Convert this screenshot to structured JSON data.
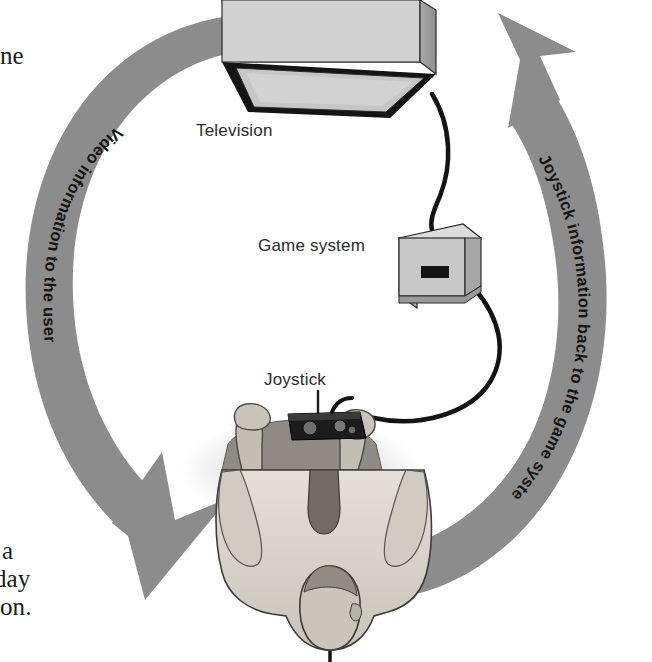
{
  "figure": {
    "name": "game-system-feedback-loop"
  },
  "page_text_fragments": [
    {
      "id": "ne",
      "text": "ne"
    },
    {
      "id": "a",
      "text": "a"
    },
    {
      "id": "day",
      "text": "day"
    },
    {
      "id": "on",
      "text": "on."
    }
  ],
  "callouts": {
    "television": "Television",
    "game_system": "Game system",
    "joystick": "Joystick"
  },
  "arrows": {
    "left": {
      "label": "Video information to the user",
      "direction": "downward-clockwise-to-user"
    },
    "right": {
      "label": "Joystick information back to the game system",
      "direction": "upward-clockwise-to-television"
    }
  },
  "colors": {
    "arrow_gray": "#8c8c8c",
    "arrow_gray_dark": "#7d7d7d",
    "device_face_light": "#d2d2d2",
    "device_face_mid": "#b4b4b4",
    "device_face_dark": "#9a9a9a",
    "outline": "#1c1c1c",
    "screen_gray": "#c4c4c4",
    "cable_black": "#141414",
    "text_black": "#1a1a1a",
    "person_shirt": "#d8d6cf",
    "person_skin": "#b9b4aa",
    "person_dark": "#8e8b84",
    "page_background": "#ffffff"
  }
}
